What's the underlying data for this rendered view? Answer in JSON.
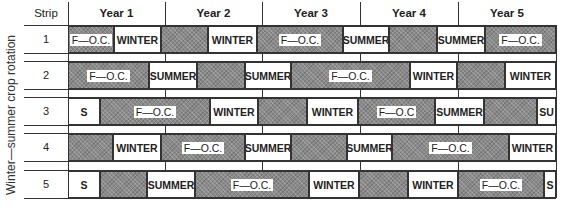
{
  "side_label": "Winter—summer crop rotation",
  "header": {
    "strip": "Strip",
    "years": [
      "Year 1",
      "Year 2",
      "Year 3",
      "Year 4",
      "Year 5"
    ]
  },
  "colors": {
    "shade": "#8a8a8a",
    "clear": "#ffffff",
    "line": "#333333"
  },
  "strips": [
    {
      "label": "1",
      "segments": [
        {
          "x0": 68,
          "x1": 114,
          "type": "shade",
          "text": "F—O.C."
        },
        {
          "x0": 114,
          "x1": 161,
          "type": "clear",
          "text": "WINTER"
        },
        {
          "x0": 161,
          "x1": 208,
          "type": "shade",
          "text": ""
        },
        {
          "x0": 208,
          "x1": 257,
          "type": "clear",
          "text": "WINTER"
        },
        {
          "x0": 257,
          "x1": 343,
          "type": "shade",
          "text": "F—O.C."
        },
        {
          "x0": 343,
          "x1": 389,
          "type": "clear",
          "text": "SUMMER"
        },
        {
          "x0": 389,
          "x1": 437,
          "type": "shade",
          "text": ""
        },
        {
          "x0": 437,
          "x1": 485,
          "type": "clear",
          "text": "SUMMER"
        },
        {
          "x0": 485,
          "x1": 556,
          "type": "shade",
          "text": "F—O.C."
        }
      ]
    },
    {
      "label": "2",
      "segments": [
        {
          "x0": 68,
          "x1": 149,
          "type": "shade",
          "text": "F—O.C."
        },
        {
          "x0": 149,
          "x1": 197,
          "type": "clear",
          "text": "SUMMER"
        },
        {
          "x0": 197,
          "x1": 245,
          "type": "shade",
          "text": ""
        },
        {
          "x0": 245,
          "x1": 291,
          "type": "clear",
          "text": "SUMMER"
        },
        {
          "x0": 291,
          "x1": 410,
          "type": "shade",
          "text": "F—O.C."
        },
        {
          "x0": 410,
          "x1": 457,
          "type": "clear",
          "text": "WINTER"
        },
        {
          "x0": 457,
          "x1": 505,
          "type": "shade",
          "text": ""
        },
        {
          "x0": 505,
          "x1": 556,
          "type": "clear",
          "text": "WINTER"
        }
      ]
    },
    {
      "label": "3",
      "segments": [
        {
          "x0": 68,
          "x1": 100,
          "type": "clear",
          "text": "S"
        },
        {
          "x0": 100,
          "x1": 210,
          "type": "shade",
          "text": "F—O.C."
        },
        {
          "x0": 210,
          "x1": 258,
          "type": "clear",
          "text": "WINTER"
        },
        {
          "x0": 258,
          "x1": 307,
          "type": "shade",
          "text": ""
        },
        {
          "x0": 307,
          "x1": 358,
          "type": "clear",
          "text": "WINTER"
        },
        {
          "x0": 358,
          "x1": 435,
          "type": "shade",
          "text": "F—O.C"
        },
        {
          "x0": 435,
          "x1": 484,
          "type": "clear",
          "text": "SUMMER"
        },
        {
          "x0": 484,
          "x1": 537,
          "type": "shade",
          "text": ""
        },
        {
          "x0": 537,
          "x1": 556,
          "type": "clear",
          "text": "SU"
        }
      ]
    },
    {
      "label": "4",
      "segments": [
        {
          "x0": 68,
          "x1": 113,
          "type": "shade",
          "text": ""
        },
        {
          "x0": 113,
          "x1": 161,
          "type": "clear",
          "text": "WINTER"
        },
        {
          "x0": 161,
          "x1": 245,
          "type": "shade",
          "text": "F—O.C."
        },
        {
          "x0": 245,
          "x1": 291,
          "type": "clear",
          "text": "SUMMER"
        },
        {
          "x0": 291,
          "x1": 347,
          "type": "shade",
          "text": ""
        },
        {
          "x0": 347,
          "x1": 392,
          "type": "clear",
          "text": "SUMMER"
        },
        {
          "x0": 392,
          "x1": 509,
          "type": "shade",
          "text": "F—O.C."
        },
        {
          "x0": 509,
          "x1": 556,
          "type": "clear",
          "text": "WINTER"
        }
      ]
    },
    {
      "label": "5",
      "segments": [
        {
          "x0": 68,
          "x1": 100,
          "type": "clear",
          "text": "S"
        },
        {
          "x0": 100,
          "x1": 147,
          "type": "shade",
          "text": ""
        },
        {
          "x0": 147,
          "x1": 195,
          "type": "clear",
          "text": "SUMMER"
        },
        {
          "x0": 195,
          "x1": 309,
          "type": "shade",
          "text": "F—O.C."
        },
        {
          "x0": 309,
          "x1": 359,
          "type": "clear",
          "text": "WINTER"
        },
        {
          "x0": 359,
          "x1": 408,
          "type": "shade",
          "text": ""
        },
        {
          "x0": 408,
          "x1": 458,
          "type": "clear",
          "text": "WINTER"
        },
        {
          "x0": 458,
          "x1": 544,
          "type": "shade",
          "text": "F—O.C."
        },
        {
          "x0": 544,
          "x1": 556,
          "type": "clear",
          "text": "S"
        }
      ]
    }
  ]
}
